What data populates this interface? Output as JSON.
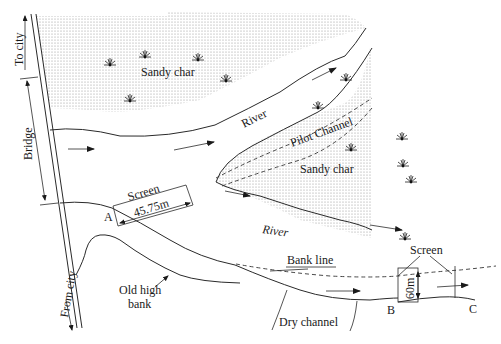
{
  "figure": {
    "type": "site-plan",
    "colors": {
      "ink": "#1a1a1a",
      "sand_dot": "#9a9a9a",
      "background": "#ffffff"
    }
  },
  "labels": {
    "to_city": "To city",
    "bridge": "Bridge",
    "from_city": "From city",
    "sandy_char_top": "Sandy char",
    "sandy_char_right": "Sandy char",
    "river_upper": "River",
    "river_lower": "River",
    "pilot_channel": "Pilot Channel",
    "screen_a": "Screen",
    "screen_a_length": "45.75m",
    "point_a": "A",
    "old_high_bank": [
      "Old high",
      "bank"
    ],
    "bank_line": "Bank line",
    "screen_b": "Screen",
    "screen_b_length": "60m",
    "point_b": "B",
    "point_c": "C",
    "dry_channel": "Dry channel"
  },
  "icons": {
    "vegetation": "grass-tuft-icon",
    "flow": "flow-arrow-icon"
  }
}
